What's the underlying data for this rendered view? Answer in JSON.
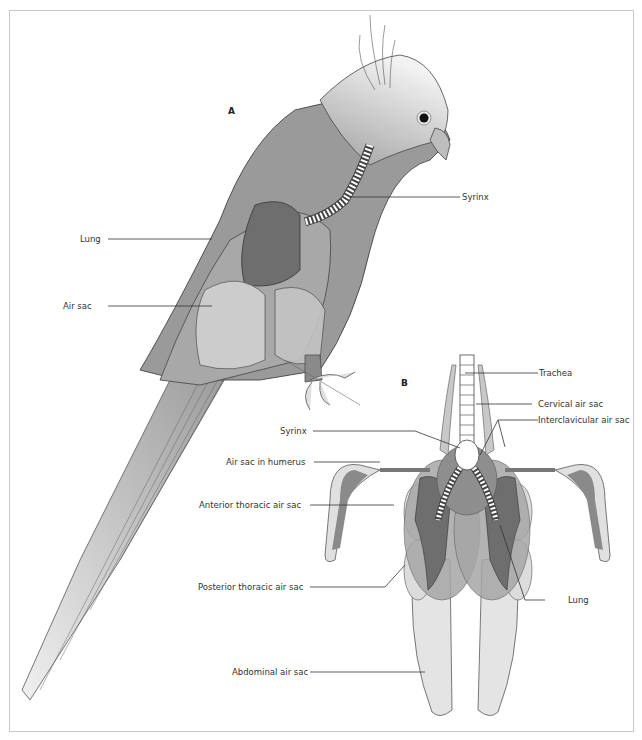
{
  "figure": {
    "panel_a": {
      "letter": "A",
      "labels": {
        "syrinx": "Syrinx",
        "lung": "Lung",
        "air_sac": "Air sac"
      }
    },
    "panel_b": {
      "letter": "B",
      "labels": {
        "trachea": "Trachea",
        "cervical_air_sac": "Cervical air sac",
        "interclavicular_air_sac": "Interclavicular air sac",
        "syrinx": "Syrinx",
        "air_sac_in_humerus": "Air sac in humerus",
        "anterior_thoracic_air_sac": "Anterior thoracic air sac",
        "posterior_thoracic_air_sac": "Posterior thoracic air sac",
        "lung": "Lung",
        "abdominal_air_sac": "Abdominal air sac"
      }
    },
    "colors": {
      "body": "#9a9a9a",
      "lung": "#6e6e6e",
      "air_sac": "#d9d9d9",
      "head": "#ececec",
      "outline": "#444444",
      "frame": "#c8c8c8"
    }
  }
}
